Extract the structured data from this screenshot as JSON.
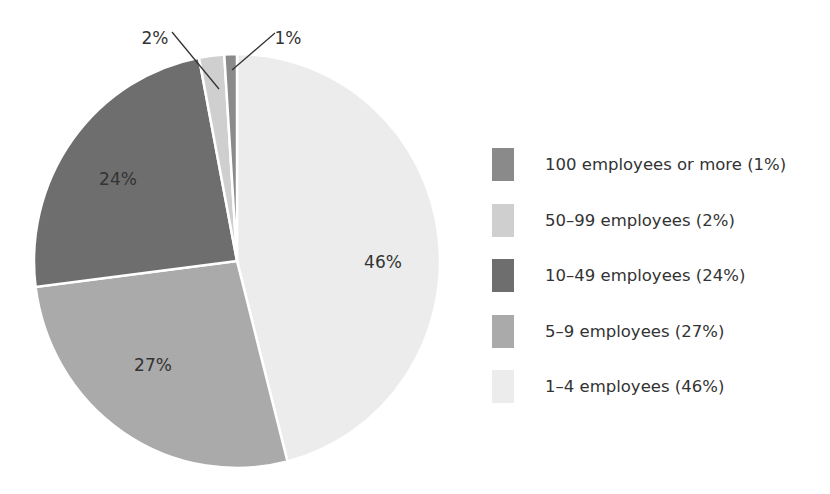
{
  "chart_data": {
    "type": "pie",
    "title": "",
    "slices": [
      {
        "label": "1–4 employees",
        "value": 46,
        "color": "#ececec",
        "label_text": "46%"
      },
      {
        "label": "5–9 employees",
        "value": 27,
        "color": "#aaaaaa",
        "label_text": "27%"
      },
      {
        "label": "10–49 employees",
        "value": 24,
        "color": "#6e6e6e",
        "label_text": "24%"
      },
      {
        "label": "50–99 employees",
        "value": 2,
        "color": "#cfcfcf",
        "label_text": "2%"
      },
      {
        "label": "100 employees or more",
        "value": 1,
        "color": "#8a8a8a",
        "label_text": "1%"
      }
    ],
    "legend_position": "right"
  },
  "legend": {
    "items": [
      {
        "label": "100 employees or more (1%)",
        "color": "#8a8a8a"
      },
      {
        "label": "50–99 employees (2%)",
        "color": "#cfcfcf"
      },
      {
        "label": "10–49 employees (24%)",
        "color": "#6e6e6e"
      },
      {
        "label": "5–9 employees (27%)",
        "color": "#aaaaaa"
      },
      {
        "label": "1–4 employees (46%)",
        "color": "#ececec"
      }
    ]
  }
}
